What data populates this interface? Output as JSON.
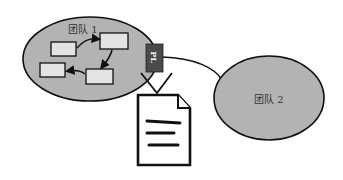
{
  "diagram": {
    "team1": {
      "label": "团队 1",
      "fill": "#b3b3b3"
    },
    "team2": {
      "label": "团队 2",
      "fill": "#b3b3b3"
    },
    "pl_tag": {
      "label": "PL",
      "fill": "#4a4a4a"
    },
    "task_boxes": 4,
    "document": {
      "icon": "document-icon",
      "lines": 3
    }
  }
}
